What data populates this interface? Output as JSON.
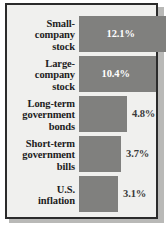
{
  "chart_data": {
    "type": "bar",
    "orientation": "horizontal",
    "title": "",
    "xlabel": "",
    "ylabel": "",
    "categories": [
      "Small-company stock",
      "Large-company stock",
      "Long-term government bonds",
      "Short-term government bills",
      "U.S. inflation"
    ],
    "values": [
      12.1,
      10.4,
      4.8,
      3.7,
      3.1
    ],
    "value_labels": [
      "12.1%",
      "10.4%",
      "4.8%",
      "3.7%",
      "3.1%"
    ],
    "label_lines": [
      [
        "Small-",
        "company",
        "stock"
      ],
      [
        "Large-",
        "company",
        "stock"
      ],
      [
        "Long-term",
        "government",
        "bonds"
      ],
      [
        "Short-term",
        "government",
        "bills"
      ],
      [
        "U.S.",
        "inflation"
      ]
    ],
    "label_position": [
      "inside",
      "inside",
      "outside",
      "outside",
      "outside"
    ],
    "xlim": [
      0,
      13.5
    ],
    "grid": false,
    "legend": "none"
  },
  "style": {
    "bar_color": "#80807e",
    "panel_color": "#f0f0ee",
    "border_color": "#2b2b2b",
    "inside_label_color": "#ffffff",
    "outside_label_color": "#3a3a3a",
    "category_label_color": "#1d1d1d"
  }
}
